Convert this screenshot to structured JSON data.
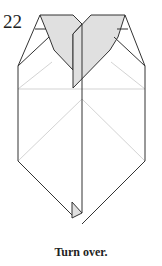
{
  "diagram": {
    "step_number": "22",
    "caption": "Turn over.",
    "colors": {
      "line": "#333333",
      "crease": "#c8c8c8",
      "shade": "#e0e0e0",
      "background": "#ffffff"
    }
  }
}
